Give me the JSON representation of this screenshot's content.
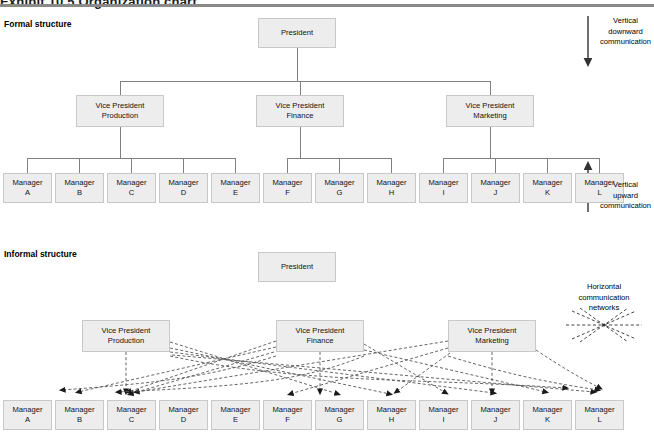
{
  "figure": {
    "title": "Exhibit 10.5   Organization chart",
    "sections": {
      "formal": "Formal structure",
      "informal": "Informal structure"
    }
  },
  "annotations": {
    "vertical_downward": {
      "line1": "Vertical",
      "line2": "downward",
      "line3": "communication",
      "icon": "arrow-down-icon"
    },
    "vertical_upward": {
      "line1": "Vertical",
      "line2": "upward",
      "line3": "communication",
      "icon": "arrow-up-icon"
    },
    "horizontal_networks": {
      "line1": "Horizontal",
      "line2": "communication",
      "line3": "networks",
      "icon": "network-burst-icon"
    }
  },
  "formal": {
    "president": {
      "line1": "President",
      "line2": ""
    },
    "vice_presidents": [
      {
        "line1": "Vice President",
        "line2": "Production"
      },
      {
        "line1": "Vice President",
        "line2": "Finance"
      },
      {
        "line1": "Vice President",
        "line2": "Marketing"
      }
    ],
    "managers": [
      {
        "line1": "Manager",
        "line2": "A"
      },
      {
        "line1": "Manager",
        "line2": "B"
      },
      {
        "line1": "Manager",
        "line2": "C"
      },
      {
        "line1": "Manager",
        "line2": "D"
      },
      {
        "line1": "Manager",
        "line2": "E"
      },
      {
        "line1": "Manager",
        "line2": "F"
      },
      {
        "line1": "Manager",
        "line2": "G"
      },
      {
        "line1": "Manager",
        "line2": "H"
      },
      {
        "line1": "Manager",
        "line2": "I"
      },
      {
        "line1": "Manager",
        "line2": "J"
      },
      {
        "line1": "Manager",
        "line2": "K"
      },
      {
        "line1": "Manager",
        "line2": "L"
      }
    ]
  },
  "informal": {
    "president": {
      "line1": "President",
      "line2": ""
    },
    "vice_presidents": [
      {
        "line1": "Vice President",
        "line2": "Production"
      },
      {
        "line1": "Vice President",
        "line2": "Finance"
      },
      {
        "line1": "Vice President",
        "line2": "Marketing"
      }
    ],
    "managers": [
      {
        "line1": "Manager",
        "line2": "A"
      },
      {
        "line1": "Manager",
        "line2": "B"
      },
      {
        "line1": "Manager",
        "line2": "C"
      },
      {
        "line1": "Manager",
        "line2": "D"
      },
      {
        "line1": "Manager",
        "line2": "E"
      },
      {
        "line1": "Manager",
        "line2": "F"
      },
      {
        "line1": "Manager",
        "line2": "G"
      },
      {
        "line1": "Manager",
        "line2": "H"
      },
      {
        "line1": "Manager",
        "line2": "I"
      },
      {
        "line1": "Manager",
        "line2": "J"
      },
      {
        "line1": "Manager",
        "line2": "K"
      },
      {
        "line1": "Manager",
        "line2": "L"
      }
    ]
  },
  "colors": {
    "node_fill": "#ededed",
    "node_border": "#c8c8c8",
    "connector": "#808080",
    "dashed": "#555555",
    "rule": "#8a8a8a"
  },
  "layout": {
    "formal": {
      "president": {
        "x": 258,
        "y": 18,
        "w": 78,
        "h": 30
      },
      "vp": [
        {
          "x": 76,
          "y": 95,
          "w": 88,
          "h": 32
        },
        {
          "x": 256,
          "y": 95,
          "w": 88,
          "h": 32
        },
        {
          "x": 446,
          "y": 95,
          "w": 88,
          "h": 32
        }
      ],
      "mgr_y": 173,
      "mgr_w": 49,
      "mgr_h": 30,
      "mgr_x": [
        3,
        55,
        107,
        159,
        211,
        263,
        315,
        367,
        419,
        471,
        523,
        575
      ]
    },
    "informal": {
      "president": {
        "x": 258,
        "y": 252,
        "w": 78,
        "h": 30
      },
      "vp": [
        {
          "x": 82,
          "y": 320,
          "w": 88,
          "h": 32
        },
        {
          "x": 276,
          "y": 320,
          "w": 88,
          "h": 32
        },
        {
          "x": 448,
          "y": 320,
          "w": 88,
          "h": 32
        }
      ],
      "mgr_y": 400,
      "mgr_w": 49,
      "mgr_h": 30,
      "mgr_x": [
        3,
        55,
        107,
        159,
        211,
        263,
        315,
        367,
        419,
        471,
        523,
        575
      ]
    }
  }
}
